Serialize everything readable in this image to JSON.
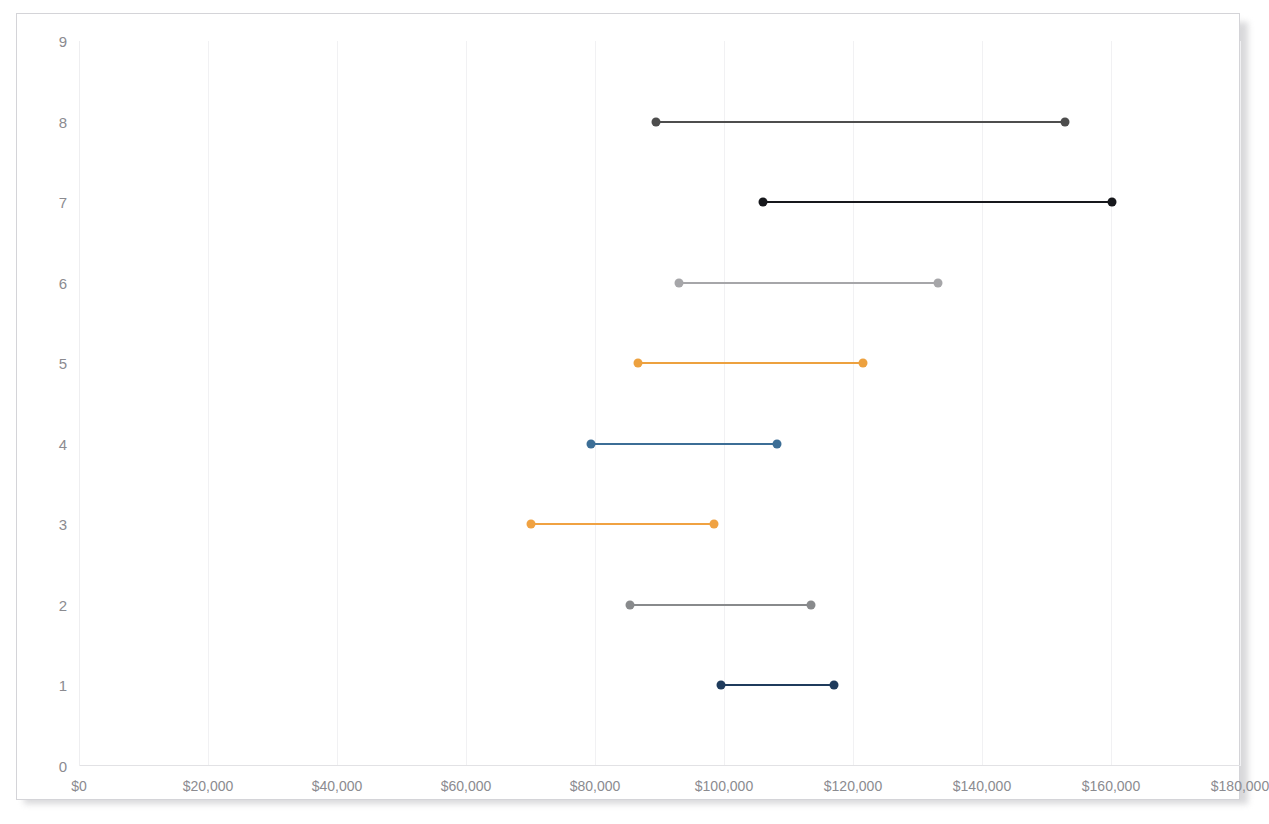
{
  "chart_data": {
    "type": "bar",
    "subtype": "range-dumbbell",
    "title": "",
    "xlabel": "",
    "ylabel": "",
    "xlim": [
      0,
      180000
    ],
    "ylim": [
      0,
      9
    ],
    "grid": true,
    "legend": "none",
    "xticks": [
      "$0",
      "$20,000",
      "$40,000",
      "$60,000",
      "$80,000",
      "$100,000",
      "$120,000",
      "$140,000",
      "$160,000",
      "$180,000"
    ],
    "xtick_values": [
      0,
      20000,
      40000,
      60000,
      80000,
      100000,
      120000,
      140000,
      160000,
      180000
    ],
    "yticks": [
      "0",
      "1",
      "2",
      "3",
      "4",
      "5",
      "6",
      "7",
      "8",
      "9"
    ],
    "ytick_values": [
      0,
      1,
      2,
      3,
      4,
      5,
      6,
      7,
      8,
      9
    ],
    "series": [
      {
        "name": "row-8",
        "category": 8,
        "low": 89500,
        "high": 152800,
        "color": "#4d4d4d"
      },
      {
        "name": "row-7",
        "category": 7,
        "low": 106000,
        "high": 160200,
        "color": "#17181c"
      },
      {
        "name": "row-6",
        "category": 6,
        "low": 93000,
        "high": 133200,
        "color": "#a6a6a9"
      },
      {
        "name": "row-5",
        "category": 5,
        "low": 86600,
        "key": "5",
        "high": 121500,
        "color": "#eda13f"
      },
      {
        "name": "row-4",
        "category": 4,
        "low": 79400,
        "high": 108200,
        "color": "#3c6e96"
      },
      {
        "name": "row-3",
        "category": 3,
        "low": 70000,
        "high": 98500,
        "color": "#f0a242"
      },
      {
        "name": "row-2",
        "category": 2,
        "low": 85400,
        "high": 113500,
        "color": "#888a8c"
      },
      {
        "name": "row-1",
        "category": 1,
        "low": 99600,
        "high": 117100,
        "color": "#1f3b5c"
      }
    ]
  },
  "colors": {
    "frame_border": "#d4d4d8",
    "gridline": "#f1f1f3",
    "axis": "#e2e2e5",
    "tick_text": "#8b8b90",
    "background": "#ffffff"
  }
}
